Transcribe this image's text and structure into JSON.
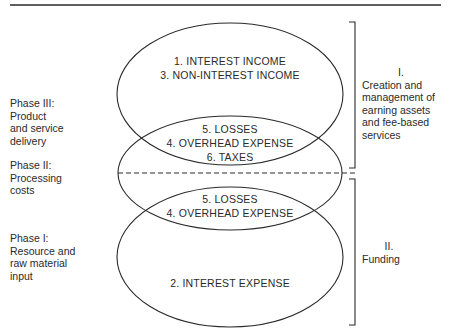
{
  "diagram": {
    "colors": {
      "line": "#2a2a2a",
      "background": "#ffffff"
    },
    "phases": [
      {
        "lines": [
          "Phase III:",
          "Product",
          "and service",
          "delivery"
        ]
      },
      {
        "lines": [
          "Phase II:",
          "Processing",
          "costs"
        ]
      },
      {
        "lines": [
          "Phase I:",
          "Resource and",
          "raw material",
          "input"
        ]
      }
    ],
    "ellipses": {
      "top": {
        "items": [
          "1.  INTEREST INCOME",
          "3.  NON-INTEREST INCOME"
        ]
      },
      "middle": {
        "items": [
          "5.  LOSSES",
          "4.  OVERHEAD EXPENSE",
          "6.  TAXES"
        ]
      },
      "bottom_overlap": {
        "items": [
          "5.  LOSSES",
          "4.  OVERHEAD EXPENSE"
        ]
      },
      "bottom": {
        "items": [
          "2.  INTEREST EXPENSE"
        ]
      }
    },
    "groups": [
      {
        "roman": "I.",
        "lines": [
          "Creation and",
          "management of",
          "earning assets",
          "and fee-based",
          "services"
        ]
      },
      {
        "roman": "II.",
        "lines": [
          "Funding"
        ]
      }
    ]
  }
}
